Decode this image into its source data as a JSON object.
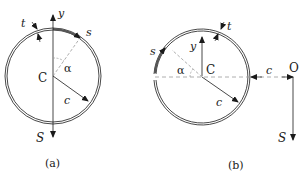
{
  "figure_a": {
    "caption": "(a)",
    "labels": {
      "thickness": "t",
      "axis_y": "y",
      "arc_coordinate": "s",
      "angle": "α",
      "centroid": "C",
      "radius": "c",
      "shear_force": "S"
    }
  },
  "figure_b": {
    "caption": "(b)",
    "labels": {
      "thickness": "t",
      "axis_y": "y",
      "arc_coordinate": "s",
      "angle": "α",
      "centroid": "C",
      "radius": "c",
      "offset_distance": "c",
      "shear_center": "O",
      "shear_force": "S"
    }
  },
  "colors": {
    "line": "#1a1a1a",
    "dashed": "#999999",
    "shear_flow": "#555555"
  }
}
